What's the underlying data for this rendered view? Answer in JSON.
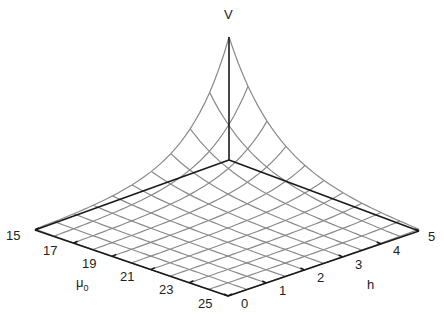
{
  "chart_data": {
    "type": "surface3d",
    "title": "",
    "axes": {
      "x": {
        "label": "h",
        "ticks": [
          0,
          1,
          2,
          3,
          4,
          5
        ],
        "range": [
          0,
          5
        ]
      },
      "y": {
        "label": "μ0",
        "label_main": "μ",
        "label_sub": "0",
        "ticks": [
          15,
          17,
          19,
          21,
          23,
          25
        ],
        "range": [
          15,
          25
        ]
      },
      "z": {
        "label": "V"
      }
    },
    "grid_lines": {
      "h_count": 11,
      "mu_count": 11
    },
    "surface_description": "V is near zero over most of the (h, μ0) domain and rises steeply (exponentially) toward h=0, μ0=15 corner",
    "peak": {
      "h": 0,
      "mu0": 15,
      "V_relative": 1.0
    },
    "decay_rate_h": 1.6,
    "decay_rate_mu": 0.38,
    "colors": {
      "axis": "#1a1a1a",
      "mesh": "#8a8a8a",
      "text": "#222222"
    }
  },
  "labels": {
    "v_axis": "V",
    "h_axis": "h",
    "mu_axis_main": "μ",
    "mu_axis_sub": "0",
    "mu_ticks": [
      "15",
      "17",
      "19",
      "21",
      "23",
      "25"
    ],
    "h_ticks": [
      "0",
      "1",
      "2",
      "3",
      "4",
      "5"
    ]
  }
}
